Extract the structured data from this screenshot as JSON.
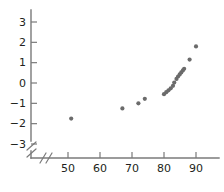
{
  "chart_data": {
    "type": "scatter",
    "title": "",
    "subtitle": "",
    "xlabel": "",
    "ylabel": "",
    "xlim": [
      44,
      94
    ],
    "ylim": [
      -3.6,
      3.6
    ],
    "grid": false,
    "legend": null,
    "axis_break": {
      "x": true,
      "y": true,
      "marker": "//"
    },
    "marker": {
      "shape": "circle",
      "color": "#6b6b6b",
      "size": 4.2
    },
    "xticks": [
      50,
      60,
      70,
      80,
      90
    ],
    "xtick_labels": [
      "50",
      "60",
      "70",
      "80",
      "90"
    ],
    "yticks": [
      3,
      2,
      1,
      0,
      -1,
      -2,
      -3
    ],
    "ytick_labels": [
      "3",
      "2",
      "1",
      "0",
      "−1",
      "−2",
      "−3"
    ],
    "points": [
      {
        "x": 51.0,
        "y": -1.75
      },
      {
        "x": 67.0,
        "y": -1.25
      },
      {
        "x": 72.0,
        "y": -1.0
      },
      {
        "x": 74.0,
        "y": -0.78
      },
      {
        "x": 80.0,
        "y": -0.55
      },
      {
        "x": 80.7,
        "y": -0.45
      },
      {
        "x": 81.4,
        "y": -0.36
      },
      {
        "x": 82.1,
        "y": -0.26
      },
      {
        "x": 82.8,
        "y": -0.14
      },
      {
        "x": 83.2,
        "y": 0.02
      },
      {
        "x": 83.9,
        "y": 0.2
      },
      {
        "x": 84.4,
        "y": 0.32
      },
      {
        "x": 84.9,
        "y": 0.42
      },
      {
        "x": 85.4,
        "y": 0.52
      },
      {
        "x": 85.9,
        "y": 0.62
      },
      {
        "x": 86.3,
        "y": 0.7
      },
      {
        "x": 88.0,
        "y": 1.15
      },
      {
        "x": 90.0,
        "y": 1.8
      }
    ]
  },
  "axes": {
    "x_axis_name": "horizontal-axis",
    "y_axis_name": "vertical-axis"
  }
}
